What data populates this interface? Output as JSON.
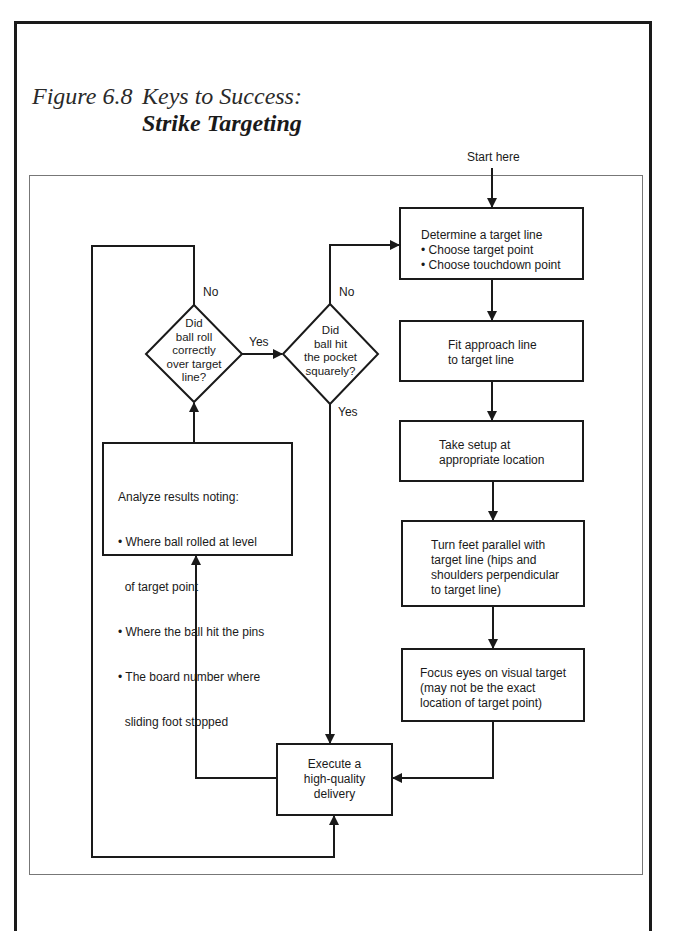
{
  "figure": {
    "number": "Figure 6.8",
    "title": "Keys to Success:",
    "subtitle": "Strike Targeting"
  },
  "flowchart": {
    "start_label": "Start here",
    "boxes": {
      "determine": {
        "line1": "Determine a target line",
        "bullets": [
          "• Choose target point",
          "• Choose touchdown point"
        ]
      },
      "fit": {
        "lines": [
          "Fit approach line",
          "to target line"
        ]
      },
      "setup": {
        "lines": [
          "Take setup at",
          "appropriate location"
        ]
      },
      "feet": {
        "lines": [
          "Turn feet parallel with",
          "target line (hips and",
          "shoulders perpendicular",
          "to target line)"
        ]
      },
      "focus": {
        "lines": [
          "Focus eyes on visual target",
          "(may not be the exact",
          "location of target point)"
        ]
      },
      "execute": {
        "lines": [
          "Execute a",
          "high-quality",
          "delivery"
        ]
      },
      "analyze": {
        "line1": "Analyze results noting:",
        "bullets": [
          "• Where ball rolled at level",
          "  of target point",
          "• Where the ball hit the pins",
          "• The board number where",
          "  sliding foot stopped"
        ]
      }
    },
    "decisions": {
      "roll": {
        "lines": [
          "Did",
          "ball roll",
          "correctly",
          "over target",
          "line?"
        ]
      },
      "pocket": {
        "lines": [
          "Did",
          "ball hit",
          "the pocket",
          "squarely?"
        ]
      }
    },
    "edge_labels": {
      "roll_no": "No",
      "roll_yes": "Yes",
      "pocket_no": "No",
      "pocket_yes": "Yes"
    }
  }
}
